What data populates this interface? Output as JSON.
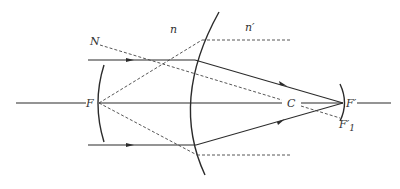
{
  "diagram": {
    "labels": {
      "N": "N",
      "n": "n",
      "n_prime": "n′",
      "F": "F",
      "C": "C",
      "F_prime": "F′",
      "F1_prime_base": "F′",
      "F1_prime_sub": "1"
    },
    "colors": {
      "line": "#2b2b2b",
      "dashed": "#444444",
      "label": "#333333",
      "background": "#ffffff"
    }
  }
}
